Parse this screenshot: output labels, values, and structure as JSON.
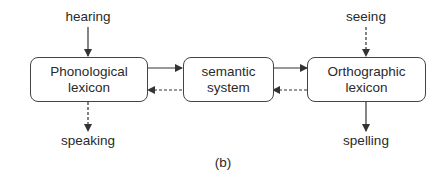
{
  "diagram": {
    "nodes": {
      "phonological": {
        "line1": "Phonological",
        "line2": "lexicon"
      },
      "semantic": {
        "line1": "semantic",
        "line2": "system"
      },
      "orthographic": {
        "line1": "Orthographic",
        "line2": "lexicon"
      }
    },
    "io_labels": {
      "hearing": "hearing",
      "speaking": "speaking",
      "seeing": "seeing",
      "spelling": "spelling"
    },
    "edges": [
      {
        "from": "hearing",
        "to": "phonological",
        "style": "solid"
      },
      {
        "from": "phonological",
        "to": "speaking",
        "style": "dashed"
      },
      {
        "from": "phonological",
        "to": "semantic",
        "style": "solid"
      },
      {
        "from": "semantic",
        "to": "phonological",
        "style": "dashed"
      },
      {
        "from": "semantic",
        "to": "orthographic",
        "style": "solid"
      },
      {
        "from": "orthographic",
        "to": "semantic",
        "style": "dashed"
      },
      {
        "from": "seeing",
        "to": "orthographic",
        "style": "dashed"
      },
      {
        "from": "orthographic",
        "to": "spelling",
        "style": "solid"
      }
    ],
    "caption": "(b)"
  }
}
